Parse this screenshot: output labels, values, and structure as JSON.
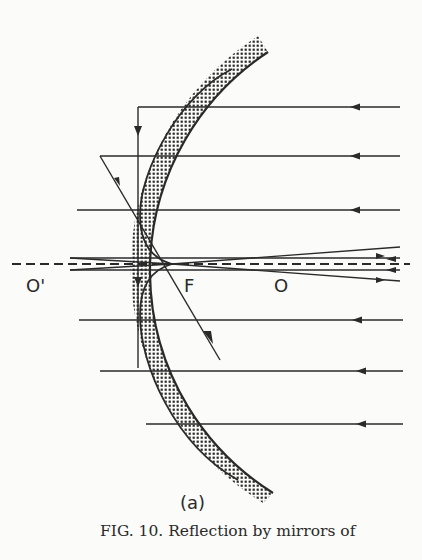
{
  "figure": {
    "panel_label": "(a)",
    "caption": "FIG. 10.  Reflection by mirrors of",
    "labels": {
      "mirror_vertex": "O'",
      "focus": "F",
      "center": "O"
    },
    "elements": {
      "mirror": "concave spherical mirror with stippled backing",
      "caustic": "caustic curve with cusp at focus F",
      "optical_axis": "dashed horizontal axis through O' F O",
      "incident_rays": "parallel rays incident from the right",
      "reflected_rays": "reflected rays converging near F"
    },
    "colors": {
      "ink": "#2a2a2a",
      "paper": "#fbfbf9"
    }
  }
}
